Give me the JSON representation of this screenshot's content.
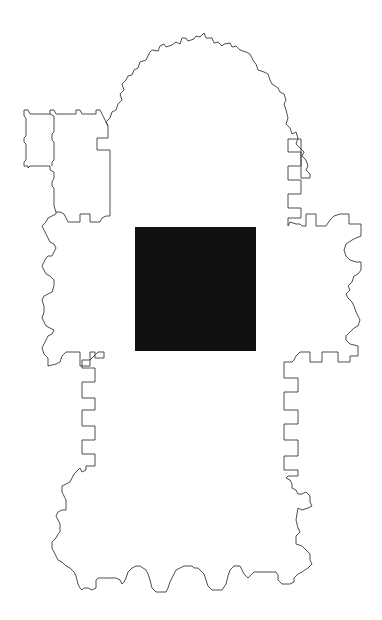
{
  "diagram": {
    "type": "architectural-floor-plan",
    "background_color": "#ffffff",
    "outline_color": "#3a3a3a",
    "parts": [
      {
        "name": "apse",
        "description": "rounded east end with buttressed, stepped edges"
      },
      {
        "name": "choir",
        "description": "straight section below apse with rectangular buttress niches"
      },
      {
        "name": "sacristy-annex",
        "description": "two rectangular rooms attached on the upper left"
      },
      {
        "name": "north-transept",
        "description": "left arm with scalloped/lobed outer wall"
      },
      {
        "name": "south-transept",
        "description": "right arm with semicircular apsidal niches"
      },
      {
        "name": "nave",
        "description": "long lower section with rectangular buttress niches"
      },
      {
        "name": "west-front",
        "description": "bottom edge with three rounded portal bays"
      }
    ],
    "crossing_block": {
      "label": "crossing",
      "color": "#111111",
      "x": 135,
      "y": 227,
      "width": 121,
      "height": 124
    }
  }
}
